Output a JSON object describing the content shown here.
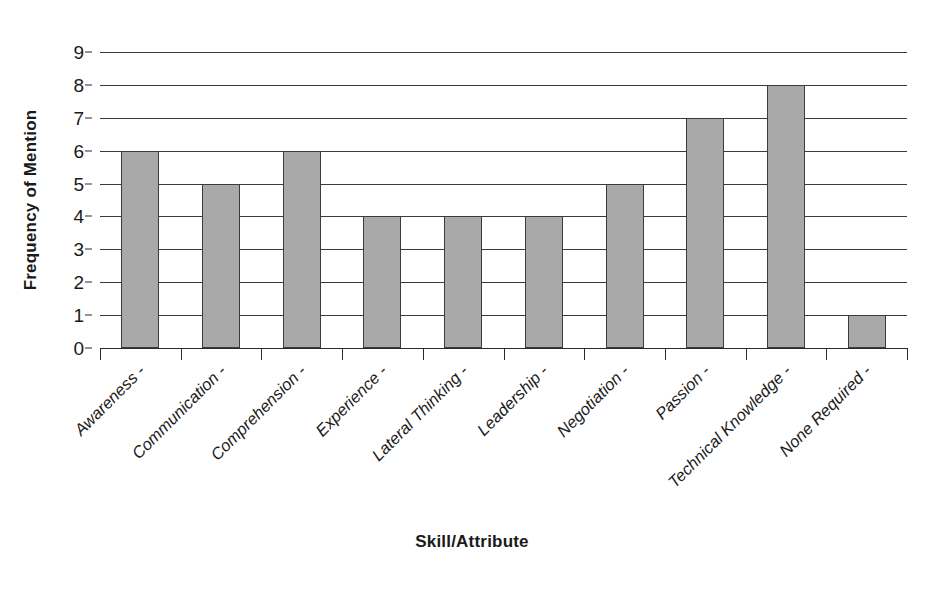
{
  "chart_data": {
    "type": "bar",
    "title": "",
    "subtitle": "",
    "xlabel": "Skill/Attribute",
    "ylabel": "Frequency of Mention",
    "categories": [
      "Awareness -",
      "Communication -",
      "Comprehension -",
      "Experience -",
      "Lateral Thinking -",
      "Leadership -",
      "Negotiation -",
      "Passion -",
      "Technical Knowledge -",
      "None Required -"
    ],
    "values": [
      6,
      5,
      6,
      4,
      4,
      4,
      5,
      7,
      8,
      1
    ],
    "ylim": [
      0,
      9
    ],
    "ytick_labels": [
      "0",
      "1",
      "2",
      "3",
      "4",
      "5",
      "6",
      "7",
      "8",
      "9"
    ],
    "ytick_values": [
      0,
      1,
      2,
      3,
      4,
      5,
      6,
      7,
      8,
      9
    ],
    "grid": "horizontal",
    "legend": "none",
    "bar_fill_color": "#a9a9a9",
    "bar_border_color": "#3c3c3c",
    "axis_color": "#2b2b2b",
    "gridline_color": "#3a3a3a",
    "background_color": "#ffffff",
    "xtick_label_rotation": -45
  }
}
